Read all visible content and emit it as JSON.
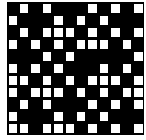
{
  "pattern": {
    "rows": 11,
    "cols": 12,
    "colors": {
      "dark": "#000000",
      "light": "#ffffff"
    },
    "white_cells": [
      [
        1,
        3,
        7,
        9,
        11
      ],
      [
        0,
        4,
        6,
        8
      ],
      [
        1,
        3,
        4,
        5,
        7,
        9,
        11
      ],
      [
        0,
        2,
        4,
        6,
        7,
        8,
        10
      ],
      [
        3,
        5,
        11
      ],
      [
        0,
        2,
        4,
        8,
        10
      ],
      [
        0,
        1,
        3,
        5,
        7,
        8,
        9,
        11
      ],
      [
        0,
        2,
        3,
        4,
        6,
        8,
        10,
        11
      ],
      [
        1,
        3,
        7,
        9,
        11
      ],
      [
        0,
        4,
        6,
        8
      ],
      [
        0,
        1,
        3,
        4,
        5,
        7,
        9,
        11
      ]
    ]
  }
}
